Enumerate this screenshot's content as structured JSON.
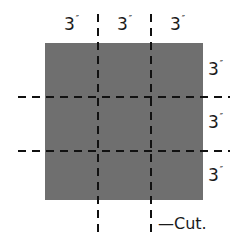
{
  "diagram": {
    "title": "",
    "square": {
      "fill": "#6f6f6f"
    },
    "top_labels": [
      {
        "value": "3",
        "unit": "″"
      },
      {
        "value": "3",
        "unit": "″"
      },
      {
        "value": "3",
        "unit": "″"
      }
    ],
    "right_labels": [
      {
        "value": "3",
        "unit": "″"
      },
      {
        "value": "3",
        "unit": "″"
      },
      {
        "value": "3",
        "unit": "″"
      }
    ],
    "cut_label": "—Cut.",
    "line_color": "#111111"
  }
}
